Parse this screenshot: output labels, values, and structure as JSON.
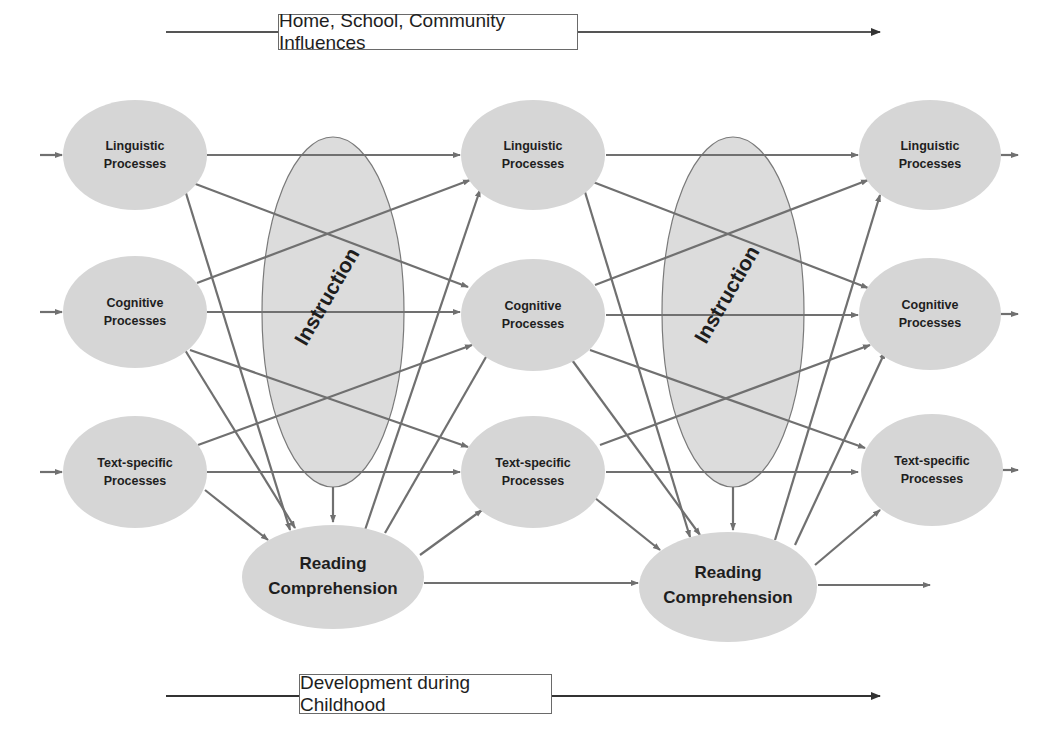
{
  "top_banner": {
    "label": "Home, School, Community Influences"
  },
  "bottom_banner": {
    "label": "Development during Childhood"
  },
  "columns": [
    {
      "linguistic": {
        "line1": "Linguistic",
        "line2": "Processes"
      },
      "cognitive": {
        "line1": "Cognitive",
        "line2": "Processes"
      },
      "text_specific": {
        "line1": "Text-specific",
        "line2": "Processes"
      }
    },
    {
      "linguistic": {
        "line1": "Linguistic",
        "line2": "Processes"
      },
      "cognitive": {
        "line1": "Cognitive",
        "line2": "Processes"
      },
      "text_specific": {
        "line1": "Text-specific",
        "line2": "Processes"
      }
    },
    {
      "linguistic": {
        "line1": "Linguistic",
        "line2": "Processes"
      },
      "cognitive": {
        "line1": "Cognitive",
        "line2": "Processes"
      },
      "text_specific": {
        "line1": "Text-specific",
        "line2": "Processes"
      }
    }
  ],
  "instruction": [
    {
      "label": "Instruction"
    },
    {
      "label": "Instruction"
    }
  ],
  "reading_comprehension": [
    {
      "line1": "Reading",
      "line2": "Comprehension"
    },
    {
      "line1": "Reading",
      "line2": "Comprehension"
    }
  ],
  "colors": {
    "node_fill": "#d6d6d6",
    "instruction_fill": "#dcdcdc",
    "edge": "#707070",
    "text": "#1e1e1e"
  }
}
